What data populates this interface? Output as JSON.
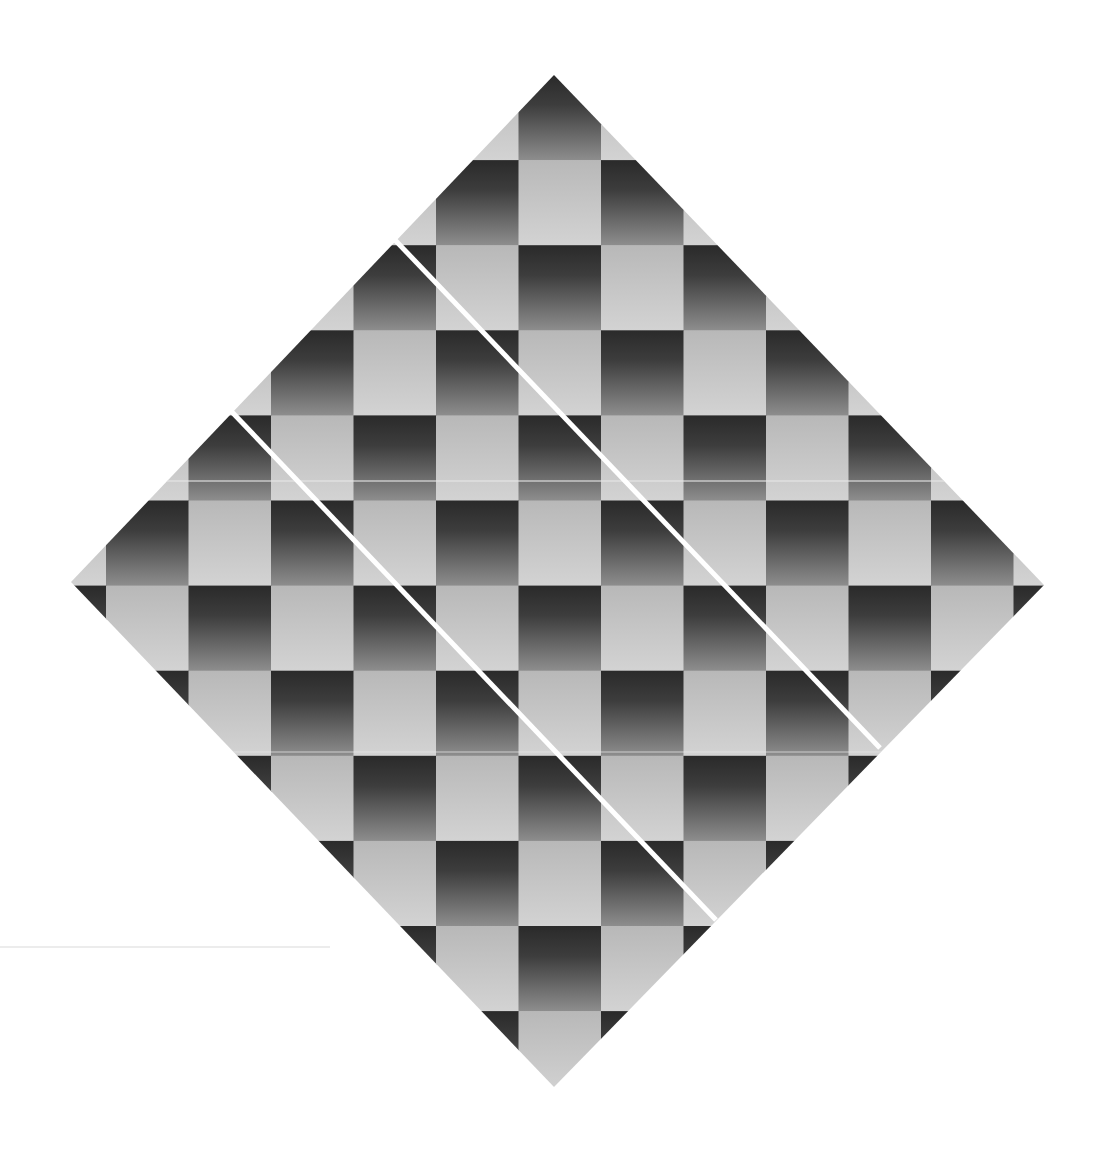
{
  "canvas": {
    "width": 1098,
    "height": 1149,
    "background": "#ffffff"
  },
  "diamond": {
    "top": [
      554,
      75
    ],
    "right": [
      1044,
      585
    ],
    "bottom": [
      554,
      1087
    ],
    "left": [
      71,
      582
    ]
  },
  "grid": {
    "origin_x": 106,
    "origin_y": 75,
    "cell_width": 82.5,
    "cell_height": 85.1,
    "col_min": -1,
    "col_max": 11,
    "row_min": 0,
    "row_max": 11,
    "dark_parity": 1
  },
  "colors": {
    "dark_top": "#2a2a2a",
    "dark_bottom": "#8e8e8e",
    "light_top": "#b8b8b8",
    "light_bottom": "#d3d3d3",
    "cut_line": "#ffffff",
    "seam": "#e6e6e6",
    "stray_line": "#d9d9d9"
  },
  "cuts": [
    {
      "x1": 395,
      "y1": 240,
      "x2": 880,
      "y2": 748,
      "width": 5
    },
    {
      "x1": 231,
      "y1": 411,
      "x2": 716,
      "y2": 920,
      "width": 5
    }
  ],
  "seams": [
    {
      "y": 481,
      "width": 1.5
    },
    {
      "y": 752,
      "width": 1
    }
  ],
  "stray_line": {
    "x1": 0,
    "y1": 947,
    "x2": 330,
    "y2": 947,
    "width": 1.2
  }
}
